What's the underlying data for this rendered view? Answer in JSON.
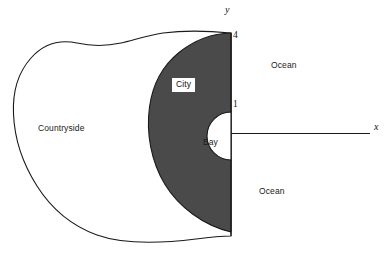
{
  "figure": {
    "title": "",
    "type": "geometric-region-diagram",
    "width": 389,
    "height": 256,
    "background_color": "#ffffff",
    "line_color": "#1a1a1a",
    "city_fill_color": "#4a4a4a",
    "water_fill_color": "#ffffff",
    "land_fill_color": "#ffffff"
  },
  "axes": {
    "x_axis_name": "x",
    "y_axis_name": "y",
    "x_axis_line": {
      "x1": 231,
      "y1": 133.5,
      "x2": 370,
      "y2": 133.5
    },
    "y_axis_line": {
      "x1": 231,
      "y1": 33,
      "x2": 231,
      "y2": 236
    },
    "x_label_pos": {
      "x": 374,
      "y": 123
    },
    "y_label_pos": {
      "x": 225,
      "y": 6
    },
    "ticks": [
      {
        "value": "4",
        "axis": "y",
        "x": 233,
        "y": 31
      },
      {
        "value": "1",
        "axis": "y",
        "x": 233,
        "y": 100
      }
    ]
  },
  "regions": [
    {
      "name": "countryside",
      "label": "Countryside",
      "label_pos": {
        "x": 38,
        "y": 125
      },
      "boxed": false,
      "fill": "#ffffff"
    },
    {
      "name": "city",
      "label": "City",
      "label_pos": {
        "x": 173,
        "y": 79
      },
      "boxed": true,
      "fill": "#4a4a4a"
    },
    {
      "name": "bay",
      "label": "Bay",
      "label_pos": {
        "x": 203,
        "y": 139
      },
      "boxed": false,
      "fill": "#ffffff"
    },
    {
      "name": "ocean-upper",
      "label": "Ocean",
      "label_pos": {
        "x": 271,
        "y": 62
      },
      "boxed": false,
      "fill": "#ffffff"
    },
    {
      "name": "ocean-lower",
      "label": "Ocean",
      "label_pos": {
        "x": 259,
        "y": 188
      },
      "boxed": false,
      "fill": "#ffffff"
    }
  ],
  "geometry": {
    "city_outer_path": "M 231 33 C 213 33 195 40 180 52 C 163 65 152 85 149 107 C 145 133 150 161 164 184 C 177 206 202 225 231 232 Z",
    "bay_semicircle": {
      "cx": 231,
      "cy": 136,
      "r": 24,
      "opens": "left"
    },
    "countryside_path": "M 231 33 C 210 31 186 30 163 33 C 146 35 133 40 120 43 C 104 47 89 46 76 43 C 58 39 43 44 31 57 C 18 71 12 92 13 114 C 14 139 22 164 36 186 C 50 208 71 226 96 235 C 124 245 163 243 195 239 C 210 237 222 236 231 236",
    "city_bottom_edge_y": 232
  }
}
